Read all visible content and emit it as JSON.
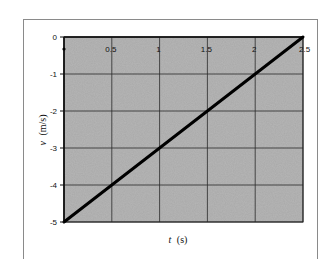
{
  "chart_data": {
    "type": "line",
    "title": "",
    "xlabel_var": "t",
    "xlabel_unit": "(s)",
    "ylabel_var": "v",
    "ylabel_unit": "(m/s)",
    "xlim": [
      0,
      2.5
    ],
    "ylim": [
      -5,
      0
    ],
    "x_ticks": [
      "0",
      "0.5",
      "1",
      "1.5",
      "2",
      "2.5"
    ],
    "y_ticks": [
      "0",
      "-1",
      "-2",
      "-3",
      "-4",
      "-5"
    ],
    "grid": true,
    "legend": null,
    "series": [
      {
        "name": "v(t)",
        "x": [
          0,
          0.5,
          1,
          1.5,
          2,
          2.5
        ],
        "y": [
          -5,
          -4,
          -3,
          -2,
          -1,
          0
        ]
      }
    ]
  },
  "colors": {
    "plot_background": "#a9a9a9",
    "grid": "#2a2a2a",
    "line": "#000000",
    "frame": "#8a8a8a"
  }
}
